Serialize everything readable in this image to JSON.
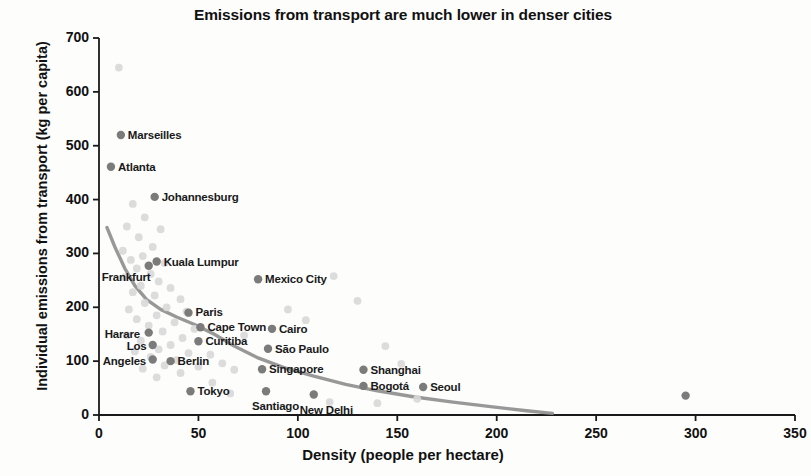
{
  "chart_data": {
    "type": "scatter",
    "title": "Emissions from transport are much lower in denser cities",
    "xlabel": "Density (people per hectare)",
    "ylabel": "Individual emissions from transport (kg per capita)",
    "xlim": [
      0,
      350
    ],
    "ylim": [
      0,
      700
    ],
    "xticks": [
      0,
      50,
      100,
      150,
      200,
      250,
      300,
      350
    ],
    "yticks": [
      0,
      100,
      200,
      300,
      400,
      500,
      600,
      700
    ],
    "grid": false,
    "legend": "none",
    "marker_color": "#7b7b7b",
    "background_marker_color": "#d8d8d8",
    "trend_color": "#8f8f8f",
    "axis_color": "#1a1a1a",
    "labeled_points": [
      {
        "city": "Marseilles",
        "x": 11,
        "y": 520,
        "label_dx": 7,
        "label_dy": -6
      },
      {
        "city": "Atlanta",
        "x": 6,
        "y": 461,
        "label_dx": 7,
        "label_dy": -6
      },
      {
        "city": "Johannesburg",
        "x": 28,
        "y": 405,
        "label_dx": 7,
        "label_dy": -6
      },
      {
        "city": "Kuala Lumpur",
        "x": 29,
        "y": 285,
        "label_dx": 7,
        "label_dy": -6
      },
      {
        "city": "Frankfurt",
        "x": 25,
        "y": 277,
        "label_dx": -47,
        "label_dy": 5
      },
      {
        "city": "Paris",
        "x": 45,
        "y": 190,
        "label_dx": 7,
        "label_dy": -7
      },
      {
        "city": "Cape Town",
        "x": 51,
        "y": 163,
        "label_dx": 7,
        "label_dy": -6
      },
      {
        "city": "Harare",
        "x": 25,
        "y": 153,
        "label_dx": -44,
        "label_dy": -5
      },
      {
        "city": "Curitiba",
        "x": 50,
        "y": 137,
        "label_dx": 7,
        "label_dy": -6
      },
      {
        "city": "Los",
        "x": 27,
        "y": 130,
        "label_dx": -26,
        "label_dy": -5
      },
      {
        "city": "Angeles",
        "x": 27,
        "y": 103,
        "label_dx": -50,
        "label_dy": -5
      },
      {
        "city": "Berlin",
        "x": 36,
        "y": 100,
        "label_dx": 7,
        "label_dy": -6
      },
      {
        "city": "Tokyo",
        "x": 46,
        "y": 44,
        "label_dx": 7,
        "label_dy": -6
      },
      {
        "city": "Mexico City",
        "x": 80,
        "y": 252,
        "label_dx": 7,
        "label_dy": -6
      },
      {
        "city": "Cairo",
        "x": 87,
        "y": 160,
        "label_dx": 7,
        "label_dy": -6
      },
      {
        "city": "São Paulo",
        "x": 85,
        "y": 123,
        "label_dx": 7,
        "label_dy": -6
      },
      {
        "city": "Singapore",
        "x": 82,
        "y": 85,
        "label_dx": 7,
        "label_dy": -6
      },
      {
        "city": "Santiago",
        "x": 84,
        "y": 44,
        "label_dx": -14,
        "label_dy": 9
      },
      {
        "city": "New Delhi",
        "x": 108,
        "y": 38,
        "label_dx": -14,
        "label_dy": 9
      },
      {
        "city": "Shanghai",
        "x": 133,
        "y": 84,
        "label_dx": 7,
        "label_dy": -6
      },
      {
        "city": "Bogotá",
        "x": 133,
        "y": 54,
        "label_dx": 7,
        "label_dy": -6
      },
      {
        "city": "Seoul",
        "x": 163,
        "y": 52,
        "label_dx": 7,
        "label_dy": -6
      }
    ],
    "unlabeled_points": [
      {
        "x": 295,
        "y": 36,
        "shade": "dark"
      },
      {
        "x": 10,
        "y": 645,
        "shade": "light"
      },
      {
        "x": 17,
        "y": 392,
        "shade": "light"
      },
      {
        "x": 23,
        "y": 367,
        "shade": "light"
      },
      {
        "x": 14,
        "y": 350,
        "shade": "light"
      },
      {
        "x": 31,
        "y": 345,
        "shade": "light"
      },
      {
        "x": 20,
        "y": 330,
        "shade": "light"
      },
      {
        "x": 27,
        "y": 312,
        "shade": "light"
      },
      {
        "x": 12,
        "y": 305,
        "shade": "light"
      },
      {
        "x": 22,
        "y": 295,
        "shade": "light"
      },
      {
        "x": 16,
        "y": 288,
        "shade": "light"
      },
      {
        "x": 33,
        "y": 282,
        "shade": "light"
      },
      {
        "x": 19,
        "y": 272,
        "shade": "light"
      },
      {
        "x": 26,
        "y": 262,
        "shade": "light"
      },
      {
        "x": 13,
        "y": 256,
        "shade": "light"
      },
      {
        "x": 30,
        "y": 248,
        "shade": "light"
      },
      {
        "x": 21,
        "y": 240,
        "shade": "light"
      },
      {
        "x": 36,
        "y": 236,
        "shade": "light"
      },
      {
        "x": 17,
        "y": 228,
        "shade": "light"
      },
      {
        "x": 28,
        "y": 222,
        "shade": "light"
      },
      {
        "x": 41,
        "y": 215,
        "shade": "light"
      },
      {
        "x": 23,
        "y": 208,
        "shade": "light"
      },
      {
        "x": 34,
        "y": 200,
        "shade": "light"
      },
      {
        "x": 15,
        "y": 196,
        "shade": "light"
      },
      {
        "x": 44,
        "y": 192,
        "shade": "light"
      },
      {
        "x": 29,
        "y": 185,
        "shade": "light"
      },
      {
        "x": 19,
        "y": 178,
        "shade": "light"
      },
      {
        "x": 38,
        "y": 172,
        "shade": "light"
      },
      {
        "x": 25,
        "y": 166,
        "shade": "light"
      },
      {
        "x": 48,
        "y": 160,
        "shade": "light"
      },
      {
        "x": 32,
        "y": 155,
        "shade": "light"
      },
      {
        "x": 14,
        "y": 148,
        "shade": "light"
      },
      {
        "x": 42,
        "y": 143,
        "shade": "light"
      },
      {
        "x": 21,
        "y": 138,
        "shade": "light"
      },
      {
        "x": 36,
        "y": 130,
        "shade": "light"
      },
      {
        "x": 30,
        "y": 122,
        "shade": "light"
      },
      {
        "x": 18,
        "y": 118,
        "shade": "light"
      },
      {
        "x": 45,
        "y": 115,
        "shade": "light"
      },
      {
        "x": 26,
        "y": 108,
        "shade": "light"
      },
      {
        "x": 39,
        "y": 102,
        "shade": "light"
      },
      {
        "x": 33,
        "y": 92,
        "shade": "light"
      },
      {
        "x": 22,
        "y": 86,
        "shade": "light"
      },
      {
        "x": 50,
        "y": 90,
        "shade": "light"
      },
      {
        "x": 41,
        "y": 78,
        "shade": "light"
      },
      {
        "x": 29,
        "y": 70,
        "shade": "light"
      },
      {
        "x": 56,
        "y": 112,
        "shade": "light"
      },
      {
        "x": 62,
        "y": 96,
        "shade": "light"
      },
      {
        "x": 68,
        "y": 84,
        "shade": "light"
      },
      {
        "x": 57,
        "y": 60,
        "shade": "light"
      },
      {
        "x": 73,
        "y": 148,
        "shade": "light"
      },
      {
        "x": 95,
        "y": 196,
        "shade": "light"
      },
      {
        "x": 104,
        "y": 176,
        "shade": "light"
      },
      {
        "x": 118,
        "y": 258,
        "shade": "light"
      },
      {
        "x": 130,
        "y": 212,
        "shade": "light"
      },
      {
        "x": 144,
        "y": 128,
        "shade": "light"
      },
      {
        "x": 152,
        "y": 95,
        "shade": "light"
      },
      {
        "x": 160,
        "y": 30,
        "shade": "light"
      },
      {
        "x": 66,
        "y": 40,
        "shade": "light"
      },
      {
        "x": 116,
        "y": 24,
        "shade": "light"
      },
      {
        "x": 140,
        "y": 22,
        "shade": "light"
      }
    ],
    "trend_curve": {
      "description": "Declining power-law fit of emissions versus density",
      "points": [
        {
          "x": 4,
          "y": 348
        },
        {
          "x": 8,
          "y": 312
        },
        {
          "x": 13,
          "y": 272
        },
        {
          "x": 18,
          "y": 240
        },
        {
          "x": 24,
          "y": 214
        },
        {
          "x": 31,
          "y": 196
        },
        {
          "x": 39,
          "y": 182
        },
        {
          "x": 48,
          "y": 168
        },
        {
          "x": 58,
          "y": 150
        },
        {
          "x": 68,
          "y": 128
        },
        {
          "x": 80,
          "y": 106
        },
        {
          "x": 93,
          "y": 88
        },
        {
          "x": 108,
          "y": 72
        },
        {
          "x": 124,
          "y": 57
        },
        {
          "x": 140,
          "y": 45
        },
        {
          "x": 158,
          "y": 34
        },
        {
          "x": 178,
          "y": 24
        },
        {
          "x": 198,
          "y": 15
        },
        {
          "x": 215,
          "y": 8
        },
        {
          "x": 228,
          "y": 3
        }
      ]
    }
  }
}
